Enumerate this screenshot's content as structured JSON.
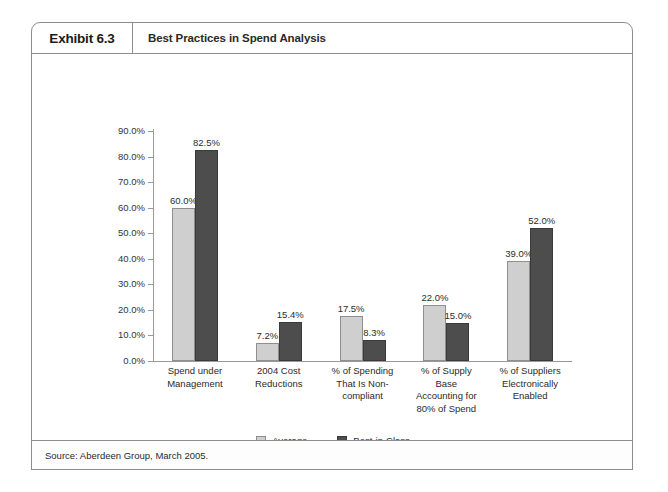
{
  "exhibit": {
    "number_label": "Exhibit 6.3",
    "title": "Best Practices in Spend Analysis",
    "source": "Source: Aberdeen Group, March 2005."
  },
  "chart_data": {
    "type": "bar",
    "title": "Best Practices in Spend Analysis",
    "xlabel": "",
    "ylabel": "",
    "ylim": [
      0,
      90
    ],
    "grid": false,
    "legend_position": "bottom-center",
    "ytick_labels": [
      "90.0%",
      "80.0%",
      "70.0%",
      "60.0%",
      "50.0%",
      "40.0%",
      "30.0%",
      "20.0%",
      "10.0%",
      "0.0%"
    ],
    "ytick_values": [
      90,
      80,
      70,
      60,
      50,
      40,
      30,
      20,
      10,
      0
    ],
    "categories": [
      "Spend under Management",
      "2004 Cost Reductions",
      "% of Spending That Is Non-compliant",
      "% of Supply Base Accounting for 80% of Spend",
      "% of Suppliers Electronically Enabled"
    ],
    "category_lines": [
      [
        "Spend under",
        "Management"
      ],
      [
        "2004 Cost",
        "Reductions"
      ],
      [
        "% of Spending",
        "That Is Non-",
        "compliant"
      ],
      [
        "% of Supply",
        "Base",
        "Accounting for",
        "80% of Spend"
      ],
      [
        "% of Suppliers",
        "Electronically",
        "Enabled"
      ]
    ],
    "series": [
      {
        "name": "Average",
        "color": "#cfcfcf",
        "values": [
          60.0,
          7.2,
          17.5,
          22.0,
          39.0
        ],
        "labels": [
          "60.0%",
          "7.2%",
          "17.5%",
          "22.0%",
          "39.0%"
        ]
      },
      {
        "name": "Best-in-Class",
        "color": "#4d4d4d",
        "values": [
          82.5,
          15.4,
          8.3,
          15.0,
          52.0
        ],
        "labels": [
          "82.5%",
          "15.4%",
          "8.3%",
          "15.0%",
          "52.0%"
        ]
      }
    ]
  }
}
